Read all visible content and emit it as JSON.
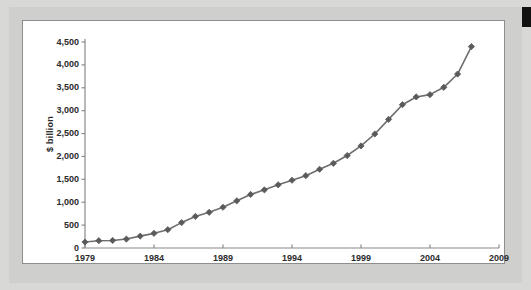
{
  "figure": {
    "panel_label": "chart-panel",
    "background_color": "#cfcfcd",
    "panel_color": "#ffffff",
    "border_color": "#8e8e8e",
    "line_color": "#6e6e6e",
    "marker_color": "#5a5a5a",
    "text_color": "#2b2b2b"
  },
  "chart_data": {
    "type": "line",
    "title": "",
    "xlabel": "",
    "ylabel": "$ billion",
    "xlim": [
      1979,
      2009
    ],
    "ylim": [
      0,
      4500
    ],
    "grid": false,
    "legend": null,
    "marker": "diamond",
    "x_tick_labels": [
      "1979",
      "1984",
      "1989",
      "1994",
      "1999",
      "2004",
      "2009"
    ],
    "x_ticks": [
      1979,
      1984,
      1989,
      1994,
      1999,
      2004,
      2009
    ],
    "y_tick_labels": [
      "0",
      "500",
      "1,000",
      "1,500",
      "2,000",
      "2,500",
      "3,000",
      "3,500",
      "4,000",
      "4,500"
    ],
    "y_ticks": [
      0,
      500,
      1000,
      1500,
      2000,
      2500,
      3000,
      3500,
      4000,
      4500
    ],
    "x": [
      1979,
      1980,
      1981,
      1982,
      1983,
      1984,
      1985,
      1986,
      1987,
      1988,
      1989,
      1990,
      1991,
      1992,
      1993,
      1994,
      1995,
      1996,
      1997,
      1998,
      1999,
      2000,
      2001,
      2002,
      2003,
      2004,
      2005,
      2006,
      2007
    ],
    "values": [
      130,
      160,
      165,
      195,
      260,
      320,
      400,
      555,
      690,
      780,
      890,
      1030,
      1170,
      1270,
      1380,
      1480,
      1580,
      1720,
      1850,
      2020,
      2230,
      2490,
      2810,
      3130,
      3300,
      3350,
      3510,
      3800,
      4400
    ],
    "series": [
      {
        "name": "$ billion",
        "values": [
          130,
          160,
          165,
          195,
          260,
          320,
          400,
          555,
          690,
          780,
          890,
          1030,
          1170,
          1270,
          1380,
          1480,
          1580,
          1720,
          1850,
          2020,
          2230,
          2490,
          2810,
          3130,
          3300,
          3350,
          3510,
          3800,
          4400
        ]
      }
    ]
  }
}
